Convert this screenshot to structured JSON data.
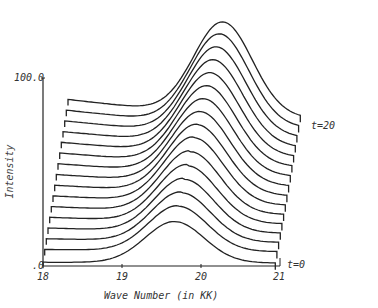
{
  "chart_data": {
    "type": "line",
    "subtype": "3d-waterfall",
    "title": "",
    "xlabel": "Wave Number (in KK)",
    "ylabel": "Intensity",
    "xlim": [
      18,
      21
    ],
    "ylim": [
      0,
      100
    ],
    "x_ticks": [
      "18",
      "19",
      "20",
      "21"
    ],
    "y_ticks": [
      ".0",
      "100.0"
    ],
    "depth_axis": {
      "label_front": "t=0",
      "label_back": "t=20",
      "steps": 16
    },
    "grid": false,
    "legend": null,
    "series_model": {
      "description": "Stacked spectra offset in depth; Gaussian band growing in intensity and shifting to higher wave number with time",
      "t_values": [
        0,
        1.33,
        2.67,
        4,
        5.33,
        6.67,
        8,
        9.33,
        10.67,
        12,
        13.33,
        14.67,
        16,
        17.33,
        18.67,
        20
      ],
      "peak_position_kk": [
        19.7,
        19.72,
        19.74,
        19.76,
        19.78,
        19.8,
        19.82,
        19.84,
        19.86,
        19.88,
        19.9,
        19.92,
        19.94,
        19.96,
        19.98,
        20.0
      ],
      "peak_intensity": [
        40,
        44,
        48,
        52,
        56,
        60,
        64,
        67,
        70,
        73,
        76,
        79,
        82,
        85,
        88,
        90
      ],
      "baseline_left_intensity": [
        2,
        6,
        10,
        14,
        18,
        22,
        26,
        30,
        34,
        38,
        42,
        46,
        50,
        54,
        58,
        62
      ]
    },
    "annotations": [
      "t=0",
      "t=20"
    ]
  },
  "axes": {
    "y_top_label": "100.0",
    "y_bottom_label": ".0",
    "x_labels": [
      "18",
      "19",
      "20",
      "21"
    ],
    "x_title": "Wave Number (in KK)",
    "y_title": "Intensity",
    "t_front": "t=0",
    "t_back": "t=20"
  }
}
